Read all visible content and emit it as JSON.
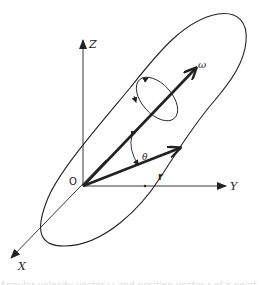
{
  "diagram": {
    "axes": {
      "z_label": "Z",
      "y_label": "Y",
      "x_label": "X",
      "origin_label": "O"
    },
    "vectors": {
      "omega_label": "ω",
      "r_label": "r",
      "angle_label": "θ"
    },
    "colors": {
      "stroke": "#222222",
      "background": "#ffffff"
    }
  },
  "caption": {
    "text": "Angular velocity vector ω and position vector r of a point in a rotating rigid body"
  }
}
